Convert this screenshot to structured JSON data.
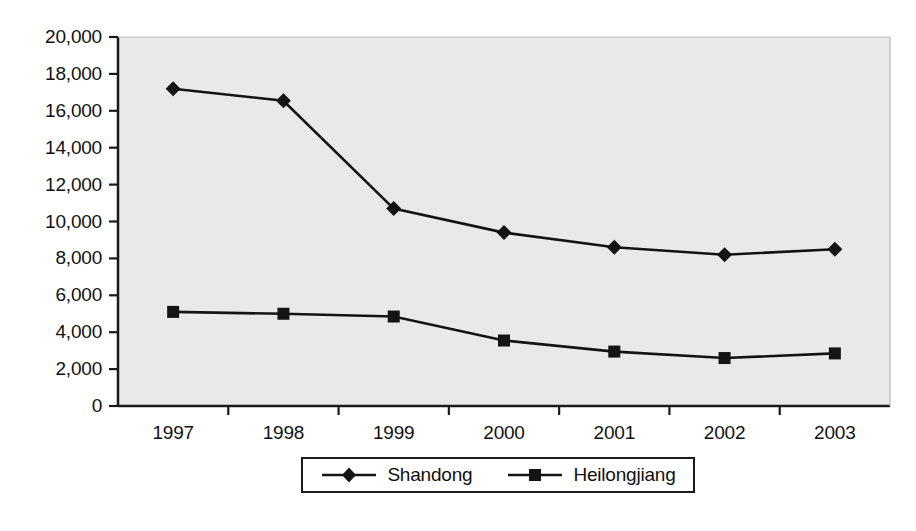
{
  "chart_data": {
    "type": "line",
    "title": "",
    "xlabel": "",
    "ylabel": "",
    "categories": [
      "1997",
      "1998",
      "1999",
      "2000",
      "2001",
      "2002",
      "2003"
    ],
    "series": [
      {
        "name": "Shandong",
        "marker": "diamond",
        "values": [
          17200,
          16550,
          10700,
          9400,
          8600,
          8200,
          8500
        ]
      },
      {
        "name": "Heilongjiang",
        "marker": "square",
        "values": [
          5100,
          5000,
          4850,
          3550,
          2950,
          2600,
          2850
        ]
      }
    ],
    "ylim": [
      0,
      20000
    ],
    "ytick_labels": [
      "0",
      "2,000",
      "4,000",
      "6,000",
      "8,000",
      "10,000",
      "12,000",
      "14,000",
      "16,000",
      "18,000",
      "20,000"
    ],
    "ytick_values": [
      0,
      2000,
      4000,
      6000,
      8000,
      10000,
      12000,
      14000,
      16000,
      18000,
      20000
    ],
    "grid": false,
    "legend_position": "bottom",
    "colors": {
      "series_line": "#141414",
      "plot_background": "#e9e9e9",
      "axis": "#1a1a1a",
      "text": "#111111"
    }
  },
  "legend": {
    "entries": [
      {
        "label": "Shandong",
        "marker": "diamond-marker-icon"
      },
      {
        "label": "Heilongjiang",
        "marker": "square-marker-icon"
      }
    ]
  }
}
